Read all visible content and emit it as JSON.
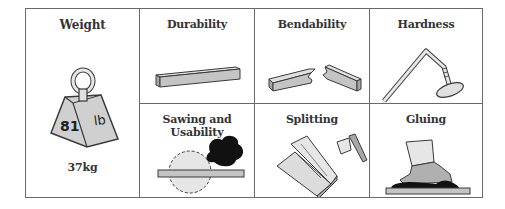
{
  "properties": [
    {
      "id": "weight",
      "label": "Weight",
      "value": "37kg",
      "weight_icon": {
        "number": "81",
        "unit": "lb"
      }
    },
    {
      "id": "durability",
      "label": "Durability"
    },
    {
      "id": "bendability",
      "label": "Bendability"
    },
    {
      "id": "hardness",
      "label": "Hardness"
    },
    {
      "id": "sawing",
      "label": "Sawing and Usability"
    },
    {
      "id": "splitting",
      "label": "Splitting"
    },
    {
      "id": "gluing",
      "label": "Gluing"
    }
  ],
  "colors": {
    "border": "#6a6a6a",
    "fill_gray": "#c8c8c8",
    "fill_light": "#e6e6e6",
    "outline": "#3a3a3a",
    "smoke": "#111111"
  }
}
